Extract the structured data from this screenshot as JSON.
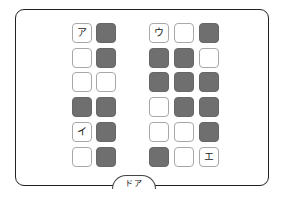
{
  "diagram": {
    "type": "seating-layout",
    "door_label": "ドア",
    "colors": {
      "occupied": "#6f6f6f",
      "empty": "#ffffff",
      "border": "#222222"
    },
    "left_group": {
      "columns_x": [
        72,
        96
      ],
      "rows": [
        [
          {
            "state": "empty",
            "label": "ア"
          },
          {
            "state": "occupied",
            "label": ""
          }
        ],
        [
          {
            "state": "empty",
            "label": ""
          },
          {
            "state": "occupied",
            "label": ""
          }
        ],
        [
          {
            "state": "empty",
            "label": ""
          },
          {
            "state": "empty",
            "label": ""
          }
        ],
        [
          {
            "state": "occupied",
            "label": ""
          },
          {
            "state": "occupied",
            "label": ""
          }
        ],
        [
          {
            "state": "empty",
            "label": "イ"
          },
          {
            "state": "occupied",
            "label": ""
          }
        ],
        [
          {
            "state": "empty",
            "label": ""
          },
          {
            "state": "occupied",
            "label": ""
          }
        ]
      ]
    },
    "right_group": {
      "columns_x": [
        149,
        174,
        199
      ],
      "rows": [
        [
          {
            "state": "empty",
            "label": "ウ"
          },
          {
            "state": "empty",
            "label": ""
          },
          {
            "state": "occupied",
            "label": ""
          }
        ],
        [
          {
            "state": "occupied",
            "label": ""
          },
          {
            "state": "occupied",
            "label": ""
          },
          {
            "state": "empty",
            "label": ""
          }
        ],
        [
          {
            "state": "occupied",
            "label": ""
          },
          {
            "state": "occupied",
            "label": ""
          },
          {
            "state": "occupied",
            "label": ""
          }
        ],
        [
          {
            "state": "empty",
            "label": ""
          },
          {
            "state": "occupied",
            "label": ""
          },
          {
            "state": "occupied",
            "label": ""
          }
        ],
        [
          {
            "state": "empty",
            "label": ""
          },
          {
            "state": "empty",
            "label": ""
          },
          {
            "state": "occupied",
            "label": ""
          }
        ],
        [
          {
            "state": "occupied",
            "label": ""
          },
          {
            "state": "empty",
            "label": ""
          },
          {
            "state": "empty",
            "label": "エ"
          }
        ]
      ]
    },
    "rows_y": [
      23,
      48,
      72,
      97,
      122,
      147
    ]
  }
}
